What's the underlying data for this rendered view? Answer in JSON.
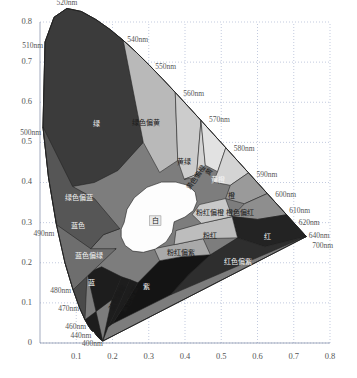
{
  "figure": {
    "type": "cie-chromaticity-diagram",
    "title": "",
    "background": "#ffffff",
    "plot_rect": {
      "x": 40,
      "y": 22,
      "w": 290,
      "h": 321
    }
  },
  "chart_data": {
    "type": "scatter",
    "title": "",
    "xlabel": "",
    "ylabel": "",
    "xlim": [
      0.0,
      0.8
    ],
    "ylim": [
      0.0,
      0.8
    ],
    "grid": true,
    "legend": "none",
    "xticks": [
      "0.1",
      "0.2",
      "0.3",
      "0.4",
      "0.5",
      "0.6",
      "0.7",
      "0.8"
    ],
    "xtick_values": [
      0.1,
      0.2,
      0.3,
      0.4,
      0.5,
      0.6,
      0.7,
      0.8
    ],
    "yticks": [
      "0",
      "0.1",
      "0.2",
      "0.3",
      "0.4",
      "0.5",
      "0.6",
      "0.7",
      "0.8"
    ],
    "ytick_values": [
      0.0,
      0.1,
      0.2,
      0.3,
      0.4,
      0.5,
      0.6,
      0.7,
      0.8
    ],
    "spectral_locus_labels": [
      {
        "text": "400nm",
        "x": 0.1733,
        "y": 0.0048,
        "anchor": "end",
        "dx": 0,
        "dy": 3
      },
      {
        "text": "440nm",
        "x": 0.1526,
        "y": 0.0234,
        "anchor": "end",
        "dx": -4,
        "dy": 3
      },
      {
        "text": "460nm",
        "x": 0.144,
        "y": 0.0297,
        "anchor": "end",
        "dx": -6,
        "dy": -4
      },
      {
        "text": "470nm",
        "x": 0.1241,
        "y": 0.0578,
        "anchor": "end",
        "dx": -6,
        "dy": -11
      },
      {
        "text": "480nm",
        "x": 0.0913,
        "y": 0.1327,
        "anchor": "end",
        "dx": -2,
        "dy": 2
      },
      {
        "text": "490nm",
        "x": 0.0454,
        "y": 0.295,
        "anchor": "end",
        "dx": -2,
        "dy": 10
      },
      {
        "text": "500nm",
        "x": 0.0082,
        "y": 0.5384,
        "anchor": "end",
        "dx": -2,
        "dy": 6
      },
      {
        "text": "510nm",
        "x": 0.0139,
        "y": 0.7502,
        "anchor": "end",
        "dx": -2,
        "dy": 4
      },
      {
        "text": "520nm",
        "x": 0.0743,
        "y": 0.8338,
        "anchor": "middle",
        "dx": 0,
        "dy": -5
      },
      {
        "text": "540nm",
        "x": 0.2296,
        "y": 0.7543,
        "anchor": "start",
        "dx": 4,
        "dy": 0
      },
      {
        "text": "550nm",
        "x": 0.3016,
        "y": 0.6923,
        "anchor": "start",
        "dx": 6,
        "dy": 2
      },
      {
        "text": "560nm",
        "x": 0.3731,
        "y": 0.6245,
        "anchor": "start",
        "dx": 8,
        "dy": 2
      },
      {
        "text": "570nm",
        "x": 0.4441,
        "y": 0.5547,
        "anchor": "start",
        "dx": 8,
        "dy": 0
      },
      {
        "text": "580nm",
        "x": 0.5125,
        "y": 0.4866,
        "anchor": "start",
        "dx": 8,
        "dy": 2
      },
      {
        "text": "590nm",
        "x": 0.5752,
        "y": 0.4242,
        "anchor": "start",
        "dx": 8,
        "dy": 2
      },
      {
        "text": "600nm",
        "x": 0.627,
        "y": 0.3725,
        "anchor": "start",
        "dx": 8,
        "dy": 2
      },
      {
        "text": "610nm",
        "x": 0.6658,
        "y": 0.334,
        "anchor": "start",
        "dx": 8,
        "dy": 2
      },
      {
        "text": "620nm",
        "x": 0.6915,
        "y": 0.3083,
        "anchor": "start",
        "dx": 8,
        "dy": 4
      },
      {
        "text": "640nm",
        "x": 0.719,
        "y": 0.2809,
        "anchor": "start",
        "dx": 8,
        "dy": 6
      },
      {
        "text": "700nm",
        "x": 0.7347,
        "y": 0.2653,
        "anchor": "start",
        "dx": 6,
        "dy": 10
      }
    ],
    "regions": [
      {
        "name": "green",
        "label": "绿",
        "x": 0.155,
        "y": 0.545,
        "tone": "dark",
        "boxed": false,
        "rotate": 0
      },
      {
        "name": "green-yellow",
        "label": "绿色偏黄",
        "x": 0.292,
        "y": 0.548,
        "tone": "light",
        "boxed": false,
        "rotate": 0
      },
      {
        "name": "yellow-green",
        "label": "黄绿",
        "x": 0.397,
        "y": 0.452,
        "tone": "light",
        "boxed": false,
        "rotate": 0
      },
      {
        "name": "yellow-orange",
        "label": "黄色偏橙",
        "x": 0.432,
        "y": 0.412,
        "tone": "light",
        "boxed": false,
        "rotate": -56
      },
      {
        "name": "yellow",
        "label": "黄",
        "x": 0.468,
        "y": 0.427,
        "tone": "light",
        "boxed": false,
        "rotate": -56
      },
      {
        "name": "yellow-orange2",
        "label": "黄橙",
        "x": 0.492,
        "y": 0.405,
        "tone": "dark",
        "boxed": false,
        "rotate": 0
      },
      {
        "name": "orange",
        "label": "橙",
        "x": 0.527,
        "y": 0.367,
        "tone": "light",
        "boxed": false,
        "rotate": 0
      },
      {
        "name": "orange-red",
        "label": "橙色偏红",
        "x": 0.553,
        "y": 0.324,
        "tone": "light",
        "boxed": false,
        "rotate": 0
      },
      {
        "name": "pink-orange",
        "label": "粉红偏橙",
        "x": 0.47,
        "y": 0.325,
        "tone": "light",
        "boxed": false,
        "rotate": 0
      },
      {
        "name": "pink",
        "label": "粉红",
        "x": 0.468,
        "y": 0.266,
        "tone": "light",
        "boxed": false,
        "rotate": 0
      },
      {
        "name": "pink-purple",
        "label": "粉红偏紫",
        "x": 0.39,
        "y": 0.224,
        "tone": "light",
        "boxed": false,
        "rotate": 0
      },
      {
        "name": "white",
        "label": "白",
        "x": 0.318,
        "y": 0.305,
        "tone": "light",
        "boxed": true,
        "rotate": 0
      },
      {
        "name": "red",
        "label": "红",
        "x": 0.627,
        "y": 0.265,
        "tone": "dark",
        "boxed": false,
        "rotate": 0
      },
      {
        "name": "red-purple",
        "label": "红色偏紫",
        "x": 0.545,
        "y": 0.201,
        "tone": "dark",
        "boxed": false,
        "rotate": 0
      },
      {
        "name": "green-blue",
        "label": "绿色偏蓝",
        "x": 0.108,
        "y": 0.362,
        "tone": "dark",
        "boxed": false,
        "rotate": 0
      },
      {
        "name": "blue-color",
        "label": "蓝色",
        "x": 0.106,
        "y": 0.292,
        "tone": "dark",
        "boxed": false,
        "rotate": 0
      },
      {
        "name": "blue-green",
        "label": "蓝色偏绿",
        "x": 0.136,
        "y": 0.216,
        "tone": "dark",
        "boxed": false,
        "rotate": 0
      },
      {
        "name": "blue",
        "label": "蓝",
        "x": 0.143,
        "y": 0.15,
        "tone": "dark",
        "boxed": false,
        "rotate": 0
      },
      {
        "name": "blue-violet",
        "label": "蓝色偏紫",
        "x": 0.214,
        "y": 0.112,
        "tone": "light",
        "boxed": false,
        "rotate": -62
      },
      {
        "name": "violet-blue",
        "label": "紫色偏蓝",
        "x": 0.249,
        "y": 0.108,
        "tone": "light",
        "boxed": false,
        "rotate": -62
      },
      {
        "name": "violet",
        "label": "紫",
        "x": 0.293,
        "y": 0.14,
        "tone": "dark",
        "boxed": false,
        "rotate": 0
      }
    ],
    "palette": {
      "green": "#3b3b3b",
      "green_yellow": "#b9b9b9",
      "yellow_green": "#cccccc",
      "yellow": "#e2e2e2",
      "yellow_orange": "#d4d4d4",
      "orange": "#9a9a9a",
      "orange_red": "#8e8e8e",
      "pink": "#bdbdbd",
      "pink_orange": "#c9c9c9",
      "pink_purple": "#a9a9a9",
      "white": "#fdfdfd",
      "red": "#232323",
      "red_purple": "#2e2e2e",
      "green_blue": "#565656",
      "blue_color": "#6e6e6e",
      "blue_green": "#4a4a4a",
      "blue": "#1d1d1d",
      "violet": "#141414",
      "grid": "#9aa7c9",
      "outline": "#202020",
      "background": "#ffffff"
    }
  }
}
